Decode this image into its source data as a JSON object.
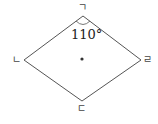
{
  "diagram": {
    "type": "rhombus",
    "vertices": {
      "top": {
        "label": "ㄱ",
        "x": 83,
        "y": 16
      },
      "left": {
        "label": "ㄴ",
        "x": 24,
        "y": 60
      },
      "bottom": {
        "label": "ㄷ",
        "x": 82,
        "y": 101
      },
      "right": {
        "label": "ㄹ",
        "x": 141,
        "y": 60
      }
    },
    "angle_label": "110°",
    "center_point": {
      "x": 82,
      "y": 59
    },
    "line_color": "#555555"
  }
}
